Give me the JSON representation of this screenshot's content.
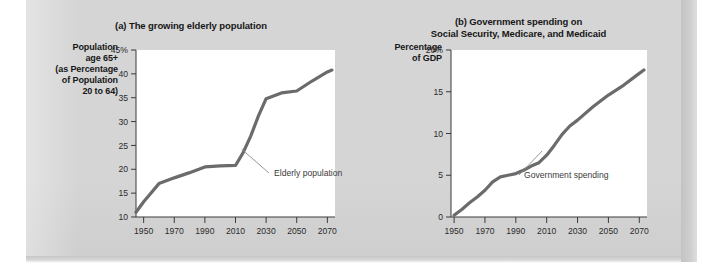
{
  "figure": {
    "background_color": "#d5d5d5",
    "panel_color": "#d5d5d5",
    "line_color": "#6b6b6b",
    "axis_color": "#3a3a3a",
    "plot_background": "#ffffff"
  },
  "chart_data": [
    {
      "id": "a",
      "type": "line",
      "title": "(a) The growing elderly population",
      "ylabel": "Population age 65+ (as Percentage of Population 20 to 64)",
      "ylabel_lines": [
        "Population",
        "age 65+",
        "(as Percentage",
        "of Population",
        "20 to 64)"
      ],
      "xlabel": "",
      "xlim": [
        1945,
        2075
      ],
      "ylim": [
        10,
        45
      ],
      "xticks": [
        1950,
        1970,
        1990,
        2010,
        2030,
        2050,
        2070
      ],
      "xtick_labels": [
        "1950",
        "1970",
        "1990",
        "2010",
        "2030",
        "2050",
        "2070"
      ],
      "yticks": [
        10,
        15,
        20,
        25,
        30,
        35,
        40,
        45
      ],
      "ytick_labels": [
        "10",
        "15",
        "20",
        "25",
        "30",
        "35",
        "40",
        "45%"
      ],
      "grid": false,
      "legend": "none",
      "series": [
        {
          "name": "Elderly population",
          "x": [
            1945,
            1950,
            1960,
            1970,
            1980,
            1990,
            2000,
            2010,
            2015,
            2020,
            2025,
            2030,
            2040,
            2050,
            2060,
            2070,
            2073
          ],
          "values": [
            11.0,
            13.2,
            17.0,
            18.2,
            19.3,
            20.5,
            20.7,
            20.8,
            23.5,
            27.0,
            31.2,
            34.8,
            36.0,
            36.4,
            38.5,
            40.4,
            40.8
          ]
        }
      ],
      "annotations": [
        {
          "text": "Elderly population",
          "target_x": 2014,
          "target_y": 24.2
        }
      ]
    },
    {
      "id": "b",
      "type": "line",
      "title_lines": [
        "(b) Government spending on",
        "Social Security, Medicare, and Medicaid"
      ],
      "title": "(b) Government spending on Social Security, Medicare, and Medicaid",
      "ylabel": "Percentage of GDP",
      "ylabel_lines": [
        "Percentage",
        "of GDP"
      ],
      "xlabel": "",
      "xlim": [
        1948,
        2075
      ],
      "ylim": [
        0,
        20
      ],
      "xticks": [
        1950,
        1970,
        1990,
        2010,
        2030,
        2050,
        2070
      ],
      "xtick_labels": [
        "1950",
        "1970",
        "1990",
        "2010",
        "2030",
        "2050",
        "2070"
      ],
      "yticks": [
        0,
        5,
        10,
        15,
        20
      ],
      "ytick_labels": [
        "0",
        "5",
        "10",
        "15",
        "20%"
      ],
      "grid": false,
      "legend": "none",
      "series": [
        {
          "name": "Government spending",
          "x": [
            1950,
            1955,
            1960,
            1965,
            1970,
            1975,
            1980,
            1985,
            1990,
            1995,
            2000,
            2005,
            2010,
            2015,
            2020,
            2025,
            2030,
            2040,
            2050,
            2060,
            2070,
            2073
          ],
          "values": [
            0.2,
            0.9,
            1.7,
            2.4,
            3.2,
            4.2,
            4.8,
            5.0,
            5.2,
            5.6,
            6.1,
            6.5,
            7.4,
            8.6,
            9.9,
            10.9,
            11.6,
            13.2,
            14.6,
            15.8,
            17.2,
            17.6
          ]
        }
      ],
      "annotations": [
        {
          "text": "Government spending",
          "target_x": 2007,
          "target_y": 7.9
        }
      ]
    }
  ]
}
